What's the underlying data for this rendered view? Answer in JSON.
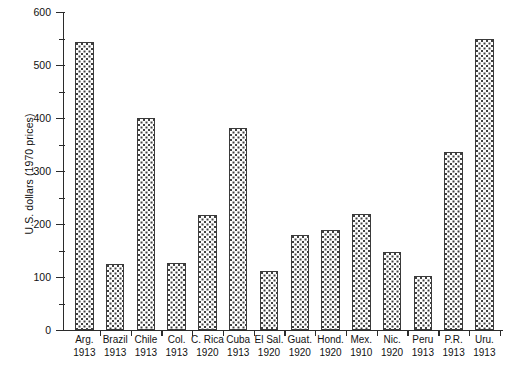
{
  "chart_data": {
    "type": "bar",
    "title": "",
    "xlabel": "",
    "ylabel": "U.S. dollars (1970 prices)",
    "ylim": [
      0,
      600
    ],
    "ytick_values": [
      0,
      100,
      200,
      300,
      400,
      500,
      600
    ],
    "ytick_labels": [
      "0",
      "100",
      "200",
      "300",
      "400",
      "500",
      "600"
    ],
    "yminor_values": [
      50,
      150,
      250,
      350,
      450,
      550
    ],
    "grid": false,
    "legend": null,
    "categories": [
      "Arg. 1913",
      "Brazil 1913",
      "Chile 1913",
      "Col. 1913",
      "C. Rica 1920",
      "Cuba 1913",
      "El Sal. 1920",
      "Guat. 1920",
      "Hond. 1920",
      "Mex. 1910",
      "Nic. 1920",
      "Peru 1913",
      "P.R. 1913",
      "Uru. 1913"
    ],
    "category_lines": [
      {
        "name": "Arg.",
        "year": "1913"
      },
      {
        "name": "Brazil",
        "year": "1913"
      },
      {
        "name": "Chile",
        "year": "1913"
      },
      {
        "name": "Col.",
        "year": "1913"
      },
      {
        "name": "C. Rica",
        "year": "1920"
      },
      {
        "name": "Cuba",
        "year": "1913"
      },
      {
        "name": "El Sal.",
        "year": "1920"
      },
      {
        "name": "Guat.",
        "year": "1920"
      },
      {
        "name": "Hond.",
        "year": "1920"
      },
      {
        "name": "Mex.",
        "year": "1910"
      },
      {
        "name": "Nic.",
        "year": "1920"
      },
      {
        "name": "Peru",
        "year": "1913"
      },
      {
        "name": "P.R.",
        "year": "1913"
      },
      {
        "name": "Uru.",
        "year": "1913"
      }
    ],
    "values": [
      544,
      124,
      400,
      126,
      217,
      381,
      112,
      180,
      188,
      218,
      147,
      102,
      336,
      550
    ],
    "bar_fill": "#fdfdfd",
    "bar_pattern": "dotted",
    "bar_edge_color": "#3a3a3a",
    "axis_color": "#2b2b2b",
    "background": "#ffffff"
  }
}
